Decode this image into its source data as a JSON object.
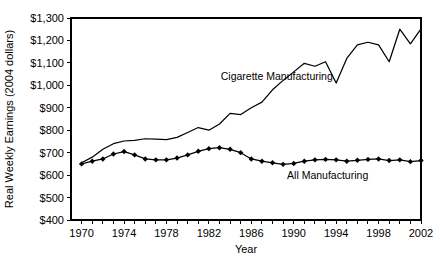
{
  "chart_data": {
    "type": "line",
    "title": "",
    "xlabel": "Year",
    "ylabel": "Real Weekly Earnings (2004 dollars)",
    "xlim": [
      1969,
      2002
    ],
    "ylim": [
      400,
      1300
    ],
    "ytick_step": 100,
    "xtick_step": 1,
    "xtick_label_step": 4,
    "grid": false,
    "legend_position": "inline-annotation",
    "ytick_labels": [
      "$400",
      "$500",
      "$600",
      "$700",
      "$800",
      "$900",
      "$1,000",
      "$1,100",
      "$1,200",
      "$1,300"
    ],
    "ytick_values": [
      400,
      500,
      600,
      700,
      800,
      900,
      1000,
      1100,
      1200,
      1300
    ],
    "xtick_labels": [
      "1970",
      "1974",
      "1978",
      "1982",
      "1986",
      "1990",
      "1994",
      "1998",
      "2002"
    ],
    "xtick_values": [
      1970,
      1974,
      1978,
      1982,
      1986,
      1990,
      1994,
      1998,
      2002
    ],
    "x": [
      1970,
      1971,
      1972,
      1973,
      1974,
      1975,
      1976,
      1977,
      1978,
      1979,
      1980,
      1981,
      1982,
      1983,
      1984,
      1985,
      1986,
      1987,
      1988,
      1989,
      1990,
      1991,
      1992,
      1993,
      1994,
      1995,
      1996,
      1997,
      1998,
      1999,
      2000,
      2001,
      2002
    ],
    "series": [
      {
        "name": "Cigarette Manufacturing",
        "label": "Cigarette Manufacturing",
        "marker": "none",
        "label_x": 1988.4,
        "label_y": 1022,
        "values": [
          655,
          680,
          715,
          740,
          752,
          755,
          762,
          760,
          758,
          768,
          790,
          812,
          800,
          828,
          875,
          870,
          900,
          925,
          980,
          1022,
          1060,
          1098,
          1085,
          1105,
          1010,
          1120,
          1180,
          1192,
          1180,
          1105,
          1250,
          1185,
          1252
        ]
      },
      {
        "name": "All Manufacturing",
        "label": "All Manufacturing",
        "marker": "diamond",
        "label_x": 1993.2,
        "label_y": 582,
        "values": [
          650,
          662,
          672,
          694,
          705,
          690,
          672,
          668,
          668,
          676,
          690,
          706,
          718,
          722,
          715,
          700,
          672,
          662,
          655,
          648,
          652,
          662,
          668,
          670,
          668,
          662,
          666,
          670,
          672,
          665,
          668,
          660,
          665
        ]
      }
    ]
  }
}
